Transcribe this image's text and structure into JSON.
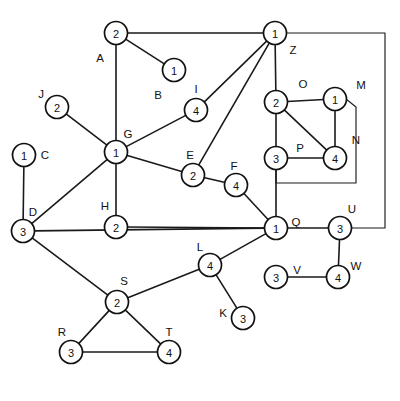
{
  "diagram": {
    "background_color": "#ffffff",
    "stroke_color": "#111111",
    "node_fill": "#ffffff",
    "node_radius": 11.5
  },
  "nodes": [
    {
      "id": "A",
      "label": "A",
      "value": "2",
      "cx": 116,
      "cy": 33,
      "lx": 100,
      "ly": 58
    },
    {
      "id": "B",
      "label": "B",
      "value": "1",
      "cx": 174,
      "cy": 70,
      "lx": 158,
      "ly": 95
    },
    {
      "id": "I",
      "label": "I",
      "value": "4",
      "cx": 196,
      "cy": 110,
      "lx": 196,
      "ly": 89
    },
    {
      "id": "J",
      "label": "J",
      "value": "2",
      "cx": 57,
      "cy": 107,
      "lx": 41,
      "ly": 94
    },
    {
      "id": "C",
      "label": "C",
      "value": "1",
      "cx": 24,
      "cy": 155,
      "lx": 45,
      "ly": 155
    },
    {
      "id": "G",
      "label": "G",
      "value": "1",
      "cx": 116,
      "cy": 152,
      "lx": 128,
      "ly": 134
    },
    {
      "id": "E",
      "label": "E",
      "value": "2",
      "cx": 193,
      "cy": 175,
      "lx": 190,
      "ly": 155
    },
    {
      "id": "F",
      "label": "F",
      "value": "4",
      "cx": 236,
      "cy": 185,
      "lx": 234,
      "ly": 166
    },
    {
      "id": "Z",
      "label": "Z",
      "value": "1",
      "cx": 275,
      "cy": 33,
      "lx": 293,
      "ly": 50
    },
    {
      "id": "O",
      "label": "O",
      "value": "2",
      "cx": 276,
      "cy": 102,
      "lx": 303,
      "ly": 84
    },
    {
      "id": "M",
      "label": "M",
      "value": "1",
      "cx": 335,
      "cy": 99,
      "lx": 361,
      "ly": 85
    },
    {
      "id": "P",
      "label": "P",
      "value": "3",
      "cx": 276,
      "cy": 158,
      "lx": 300,
      "ly": 148
    },
    {
      "id": "N",
      "label": "N",
      "value": "4",
      "cx": 335,
      "cy": 158,
      "lx": 356,
      "ly": 140
    },
    {
      "id": "D",
      "label": "D",
      "value": "3",
      "cx": 23,
      "cy": 231,
      "lx": 33,
      "ly": 212
    },
    {
      "id": "H",
      "label": "H",
      "value": "2",
      "cx": 116,
      "cy": 227,
      "lx": 105,
      "ly": 206
    },
    {
      "id": "Q",
      "label": "Q",
      "value": "1",
      "cx": 276,
      "cy": 228,
      "lx": 296,
      "ly": 222
    },
    {
      "id": "U",
      "label": "U",
      "value": "3",
      "cx": 340,
      "cy": 228,
      "lx": 352,
      "ly": 209
    },
    {
      "id": "L",
      "label": "L",
      "value": "4",
      "cx": 210,
      "cy": 265,
      "lx": 200,
      "ly": 247
    },
    {
      "id": "V",
      "label": "V",
      "value": "3",
      "cx": 276,
      "cy": 277,
      "lx": 297,
      "ly": 270
    },
    {
      "id": "W",
      "label": "W",
      "value": "4",
      "cx": 338,
      "cy": 277,
      "lx": 356,
      "ly": 266
    },
    {
      "id": "K",
      "label": "K",
      "value": "3",
      "cx": 243,
      "cy": 318,
      "lx": 223,
      "ly": 313
    },
    {
      "id": "S",
      "label": "S",
      "value": "2",
      "cx": 117,
      "cy": 302,
      "lx": 124,
      "ly": 281
    },
    {
      "id": "R",
      "label": "R",
      "value": "3",
      "cx": 71,
      "cy": 352,
      "lx": 62,
      "ly": 332
    },
    {
      "id": "T",
      "label": "T",
      "value": "4",
      "cx": 169,
      "cy": 352,
      "lx": 169,
      "ly": 332
    }
  ],
  "edges": [
    {
      "from": "A",
      "to": "Z"
    },
    {
      "from": "A",
      "to": "B"
    },
    {
      "from": "A",
      "to": "G"
    },
    {
      "from": "G",
      "to": "J"
    },
    {
      "from": "G",
      "to": "I"
    },
    {
      "from": "G",
      "to": "E"
    },
    {
      "from": "G",
      "to": "D"
    },
    {
      "from": "G",
      "to": "H"
    },
    {
      "from": "Z",
      "to": "I"
    },
    {
      "from": "Z",
      "to": "E"
    },
    {
      "from": "Z",
      "to": "O"
    },
    {
      "from": "O",
      "to": "M"
    },
    {
      "from": "O",
      "to": "P"
    },
    {
      "from": "O",
      "to": "N"
    },
    {
      "from": "M",
      "to": "N"
    },
    {
      "from": "P",
      "to": "N"
    },
    {
      "from": "P",
      "to": "Q"
    },
    {
      "from": "E",
      "to": "F"
    },
    {
      "from": "F",
      "to": "Q"
    },
    {
      "from": "C",
      "to": "D"
    },
    {
      "from": "D",
      "to": "Q"
    },
    {
      "from": "D",
      "to": "S"
    },
    {
      "from": "H",
      "to": "Q"
    },
    {
      "from": "Q",
      "to": "L"
    },
    {
      "from": "Q",
      "to": "U"
    },
    {
      "from": "U",
      "to": "W"
    },
    {
      "from": "V",
      "to": "W"
    },
    {
      "from": "L",
      "to": "S"
    },
    {
      "from": "L",
      "to": "K"
    },
    {
      "from": "S",
      "to": "R"
    },
    {
      "from": "S",
      "to": "T"
    },
    {
      "from": "R",
      "to": "T"
    }
  ],
  "routed_edges": [
    {
      "id": "Z-U-frame",
      "from": "Z",
      "to": "U",
      "points": "275,33 385,33 385,228 352,228"
    },
    {
      "id": "M-P-bracket",
      "from": "M",
      "to": "P",
      "points": "346,99 356,107 356,183 276,183 276,170"
    }
  ]
}
